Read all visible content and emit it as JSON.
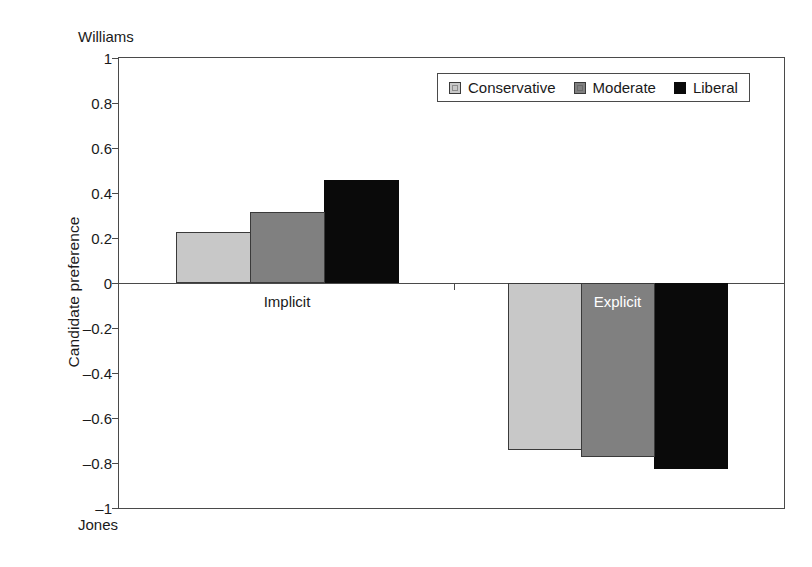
{
  "chart_data": {
    "type": "bar",
    "title": "",
    "xlabel": "",
    "ylabel": "Candidate preference",
    "ylim": [
      -1,
      1
    ],
    "grid": false,
    "legend_position": "top-right",
    "categories": [
      "Implicit",
      "Explicit"
    ],
    "series": [
      {
        "name": "Conservative",
        "color": "#c8c8c8",
        "values": [
          0.225,
          -0.74
        ]
      },
      {
        "name": "Moderate",
        "color": "#808080",
        "values": [
          0.315,
          -0.775
        ]
      },
      {
        "name": "Liberal",
        "color": "#000000",
        "values": [
          0.46,
          -0.825
        ]
      }
    ],
    "ytick_labels": [
      "1",
      "0.8",
      "0.6",
      "0.4",
      "0.2",
      "0",
      "-0.2",
      "-0.4",
      "-0.6",
      "-0.8",
      "-1"
    ],
    "ytick_values": [
      1,
      0.8,
      0.6,
      0.4,
      0.2,
      0,
      -0.2,
      -0.4,
      -0.6,
      -0.8,
      -1
    ],
    "axis_pole_labels": {
      "top": "Williams",
      "bottom": "Jones"
    }
  },
  "legend": {
    "items": [
      {
        "label": "Conservative"
      },
      {
        "label": "Moderate"
      },
      {
        "label": "Liberal"
      }
    ]
  }
}
